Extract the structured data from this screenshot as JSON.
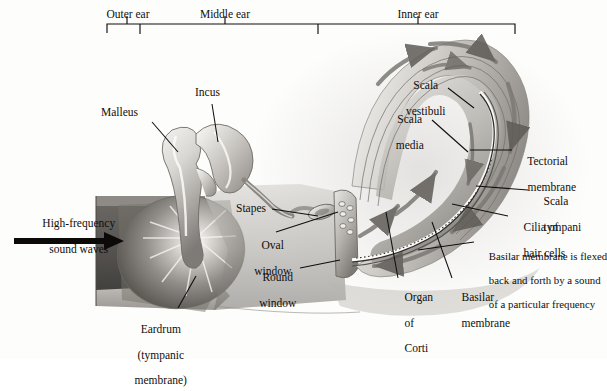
{
  "figure": {
    "background_color": "#fdfdfc",
    "ink_color": "#100f0d"
  },
  "scale_bar": {
    "regions": [
      {
        "name": "outer-ear",
        "label": "Outer ear"
      },
      {
        "name": "middle-ear",
        "label": "Middle ear"
      },
      {
        "name": "inner-ear",
        "label": "Inner ear"
      }
    ]
  },
  "stimulus": {
    "label_line1": "High-frequency",
    "label_line2": "sound waves",
    "arrow_icon": "right-arrow-icon"
  },
  "labels": {
    "malleus": "Malleus",
    "incus": "Incus",
    "stapes": "Stapes",
    "oval_window_line1": "Oval",
    "oval_window_line2": "window",
    "round_window_line1": "Round",
    "round_window_line2": "window",
    "eardrum_line1": "Eardrum",
    "eardrum_line2": "(tympanic",
    "eardrum_line3": "membrane)",
    "scala_vestibuli_line1": "Scala",
    "scala_vestibuli_line2": "vestibuli",
    "scala_media_line1": "Scala",
    "scala_media_line2": "media",
    "scala_tympani_line1": "Scala",
    "scala_tympani_line2": "tympani",
    "tectorial_line1": "Tectorial",
    "tectorial_line2": "membrane",
    "cilia_line1": "Cilia of",
    "cilia_line2": "hair cells",
    "organ_of_corti_line1": "Organ",
    "organ_of_corti_line2": "of",
    "organ_of_corti_line3": "Corti",
    "basilar_membrane_line1": "Basilar",
    "basilar_membrane_line2": "membrane",
    "flex_note_line1": "Basilar membrane is flexed",
    "flex_note_line2": "back and forth by a sound",
    "flex_note_line3": "of a particular frequency"
  }
}
